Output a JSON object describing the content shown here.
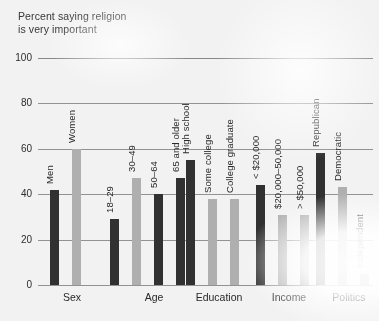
{
  "title": "Percent saying religion\nis very important",
  "axis": {
    "yticks": [
      "0",
      "20",
      "40",
      "60",
      "80",
      "100"
    ],
    "ymin": 0,
    "ymax": 100
  },
  "colors": {
    "dark_bar": "#333333",
    "light_bar": "#b9b9b9",
    "gridline": "#9a9a9a",
    "text": "#2b2b2b",
    "background": "#ffffff"
  },
  "chart_data": {
    "type": "bar",
    "title": "Percent saying religion is very important",
    "xlabel": "",
    "ylabel": "Percent",
    "ylim": [
      0,
      100
    ],
    "grid": true,
    "legend": "none",
    "categories": [
      "Sex",
      "Age",
      "Education",
      "Income",
      "Politics"
    ],
    "groups": [
      {
        "name": "Sex",
        "bars": [
          {
            "label": "Men",
            "value": 42,
            "shade": "dark"
          },
          {
            "label": "Women",
            "value": 60,
            "shade": "light"
          }
        ]
      },
      {
        "name": "Age",
        "bars": [
          {
            "label": "18–29",
            "value": 29,
            "shade": "dark"
          },
          {
            "label": "30–49",
            "value": 47,
            "shade": "light"
          },
          {
            "label": "50–64",
            "value": 40,
            "shade": "dark"
          },
          {
            "label": "65 and older",
            "value": 47,
            "shade": "dark"
          }
        ]
      },
      {
        "name": "Education",
        "bars": [
          {
            "label": "High school",
            "value": 55,
            "shade": "dark"
          },
          {
            "label": "Some college",
            "value": 38,
            "shade": "light"
          },
          {
            "label": "College graduate",
            "value": 38,
            "shade": "light"
          }
        ]
      },
      {
        "name": "Income",
        "bars": [
          {
            "label": "< $20,000",
            "value": 44,
            "shade": "dark"
          },
          {
            "label": "$20,000–50,000",
            "value": 31,
            "shade": "light"
          },
          {
            "label": "> $50,000",
            "value": 31,
            "shade": "light"
          }
        ]
      },
      {
        "name": "Politics",
        "bars": [
          {
            "label": "Republican",
            "value": 58,
            "shade": "dark"
          },
          {
            "label": "Democratic",
            "value": 43,
            "shade": "light"
          },
          {
            "label": "Independent",
            "value": 5,
            "shade": "light"
          }
        ]
      }
    ]
  }
}
